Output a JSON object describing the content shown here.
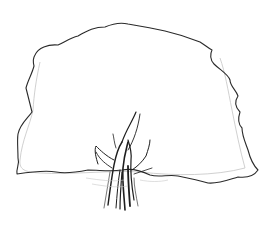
{
  "image": {
    "subject": "pencil sketch of a tree",
    "background": "#ffffff",
    "stroke_color": "#2a2a2a",
    "light_stroke_color": "#b8b8b8"
  }
}
